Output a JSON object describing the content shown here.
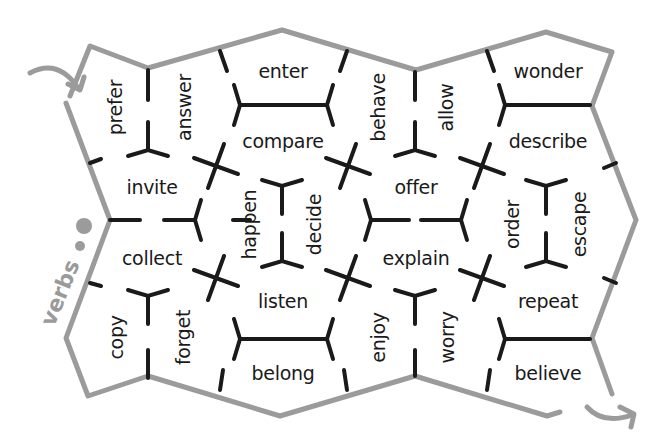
{
  "title": "verbs",
  "colors": {
    "border": "#9b9b9b",
    "ink": "#1a1a1a",
    "label": "#9a9a9a",
    "background": "#ffffff"
  },
  "words": [
    {
      "text": "prefer",
      "x": 116,
      "y": 107,
      "rot": -90
    },
    {
      "text": "answer",
      "x": 184,
      "y": 107,
      "rot": -90
    },
    {
      "text": "enter",
      "x": 283,
      "y": 71,
      "rot": 0
    },
    {
      "text": "compare",
      "x": 283,
      "y": 141,
      "rot": 0
    },
    {
      "text": "behave",
      "x": 378,
      "y": 107,
      "rot": -90
    },
    {
      "text": "allow",
      "x": 447,
      "y": 107,
      "rot": -90
    },
    {
      "text": "wonder",
      "x": 548,
      "y": 71,
      "rot": 0
    },
    {
      "text": "describe",
      "x": 548,
      "y": 141,
      "rot": 0
    },
    {
      "text": "invite",
      "x": 152,
      "y": 187,
      "rot": 0
    },
    {
      "text": "happen",
      "x": 250,
      "y": 224,
      "rot": -90
    },
    {
      "text": "decide",
      "x": 315,
      "y": 224,
      "rot": -90
    },
    {
      "text": "offer",
      "x": 416,
      "y": 187,
      "rot": 0
    },
    {
      "text": "order",
      "x": 513,
      "y": 224,
      "rot": -90
    },
    {
      "text": "escape",
      "x": 580,
      "y": 224,
      "rot": -90
    },
    {
      "text": "collect",
      "x": 152,
      "y": 258,
      "rot": 0
    },
    {
      "text": "explain",
      "x": 416,
      "y": 258,
      "rot": 0
    },
    {
      "text": "listen",
      "x": 283,
      "y": 301,
      "rot": 0
    },
    {
      "text": "repeat",
      "x": 548,
      "y": 301,
      "rot": 0
    },
    {
      "text": "copy",
      "x": 116,
      "y": 337,
      "rot": -90
    },
    {
      "text": "forget",
      "x": 184,
      "y": 337,
      "rot": -90
    },
    {
      "text": "enjoy",
      "x": 378,
      "y": 337,
      "rot": -90
    },
    {
      "text": "worry",
      "x": 447,
      "y": 337,
      "rot": -90
    },
    {
      "text": "belong",
      "x": 283,
      "y": 373,
      "rot": 0
    },
    {
      "text": "believe",
      "x": 548,
      "y": 373,
      "rot": 0
    }
  ],
  "border_path": "M 70 96 L 90 46 L 148 68 L 282 30 L 416 70 L 546 32 L 612 52 L 592 106 L 636 220 L 592 338 L 612 394 M 560 412 L 547 416 L 415 376 L 280 416 L 148 376 L 88 396 L 66 338 L 110 220 L 66 103",
  "arrows": [
    {
      "path": "M 30 73 Q 58 58 78 88",
      "head": "M 68 84 L 80 90 L 84 77"
    },
    {
      "path": "M 587 407 Q 603 425 632 415",
      "head": "M 620 407 L 634 414 L 631 427"
    }
  ],
  "dots": [
    {
      "cx": 84,
      "cy": 226,
      "r": 8
    },
    {
      "cx": 80,
      "cy": 246,
      "r": 5
    }
  ],
  "title_pos": {
    "x": 60,
    "y": 293,
    "rot": -68
  },
  "tris": [
    {
      "x": 148,
      "y": 150,
      "up": true
    },
    {
      "x": 148,
      "y": 296,
      "up": false
    },
    {
      "x": 415,
      "y": 150,
      "up": true
    },
    {
      "x": 546,
      "y": 186,
      "up": false
    },
    {
      "x": 546,
      "y": 261,
      "up": true
    },
    {
      "x": 282,
      "y": 186,
      "up": false
    },
    {
      "x": 282,
      "y": 261,
      "up": true
    },
    {
      "x": 415,
      "y": 296,
      "up": false
    }
  ],
  "sides": [
    {
      "x": 240,
      "y": 105,
      "dir": "r"
    },
    {
      "x": 327,
      "y": 105,
      "dir": "l"
    },
    {
      "x": 505,
      "y": 105,
      "dir": "r"
    },
    {
      "x": 371,
      "y": 220,
      "dir": "r"
    },
    {
      "x": 461,
      "y": 220,
      "dir": "l"
    },
    {
      "x": 195,
      "y": 220,
      "dir": "l"
    },
    {
      "x": 240,
      "y": 339,
      "dir": "r"
    },
    {
      "x": 327,
      "y": 339,
      "dir": "l"
    },
    {
      "x": 505,
      "y": 339,
      "dir": "r"
    }
  ],
  "crosses": [
    {
      "x": 216,
      "y": 166
    },
    {
      "x": 348,
      "y": 166
    },
    {
      "x": 482,
      "y": 166
    },
    {
      "x": 216,
      "y": 278
    },
    {
      "x": 348,
      "y": 278
    },
    {
      "x": 482,
      "y": 278
    }
  ],
  "segments": [
    [
      148,
      70,
      148,
      100
    ],
    [
      148,
      350,
      148,
      378
    ],
    [
      415,
      72,
      415,
      100
    ],
    [
      415,
      350,
      415,
      376
    ],
    [
      220,
      51,
      227,
      71
    ],
    [
      347,
      51,
      340,
      71
    ],
    [
      487,
      51,
      494,
      71
    ],
    [
      220,
      390,
      223,
      370
    ],
    [
      347,
      390,
      344,
      370
    ],
    [
      487,
      390,
      490,
      370
    ],
    [
      268,
      105,
      300,
      105
    ],
    [
      534,
      105,
      590,
      105
    ],
    [
      268,
      339,
      300,
      339
    ],
    [
      534,
      339,
      590,
      339
    ],
    [
      110,
      220,
      140,
      220
    ],
    [
      164,
      220,
      190,
      220
    ],
    [
      393,
      220,
      409,
      220
    ],
    [
      421,
      220,
      440,
      220
    ],
    [
      90,
      163,
      101,
      159
    ],
    [
      90,
      283,
      101,
      286
    ],
    [
      616,
      163,
      604,
      168
    ],
    [
      616,
      283,
      604,
      278
    ],
    [
      233,
      220,
      250,
      220
    ]
  ]
}
